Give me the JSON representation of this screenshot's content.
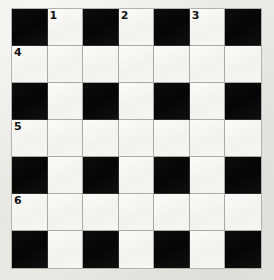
{
  "puzzle": {
    "title": "Crossword Grid",
    "rows": 7,
    "columns": 7,
    "colors": {
      "background": "#eceae6",
      "white_cell": "#f6f5f2",
      "black_cell": "#0a0a0a",
      "gridline": "#a9a9a6",
      "number_text": "#111111"
    },
    "grid": [
      [
        {
          "type": "block",
          "number": null,
          "letter": null
        },
        {
          "type": "open",
          "number": "1",
          "letter": null
        },
        {
          "type": "block",
          "number": null,
          "letter": null
        },
        {
          "type": "open",
          "number": "2",
          "letter": null
        },
        {
          "type": "block",
          "number": null,
          "letter": null
        },
        {
          "type": "open",
          "number": "3",
          "letter": null
        },
        {
          "type": "block",
          "number": null,
          "letter": null
        }
      ],
      [
        {
          "type": "open",
          "number": "4",
          "letter": null
        },
        {
          "type": "open",
          "number": null,
          "letter": null
        },
        {
          "type": "open",
          "number": null,
          "letter": null
        },
        {
          "type": "open",
          "number": null,
          "letter": null
        },
        {
          "type": "open",
          "number": null,
          "letter": null
        },
        {
          "type": "open",
          "number": null,
          "letter": null
        },
        {
          "type": "open",
          "number": null,
          "letter": null
        }
      ],
      [
        {
          "type": "block",
          "number": null,
          "letter": null
        },
        {
          "type": "open",
          "number": null,
          "letter": null
        },
        {
          "type": "block",
          "number": null,
          "letter": null
        },
        {
          "type": "open",
          "number": null,
          "letter": null
        },
        {
          "type": "block",
          "number": null,
          "letter": null
        },
        {
          "type": "open",
          "number": null,
          "letter": null
        },
        {
          "type": "block",
          "number": null,
          "letter": null
        }
      ],
      [
        {
          "type": "open",
          "number": "5",
          "letter": null
        },
        {
          "type": "open",
          "number": null,
          "letter": null
        },
        {
          "type": "open",
          "number": null,
          "letter": null
        },
        {
          "type": "open",
          "number": null,
          "letter": null
        },
        {
          "type": "open",
          "number": null,
          "letter": null
        },
        {
          "type": "open",
          "number": null,
          "letter": null
        },
        {
          "type": "open",
          "number": null,
          "letter": null
        }
      ],
      [
        {
          "type": "block",
          "number": null,
          "letter": null
        },
        {
          "type": "open",
          "number": null,
          "letter": null
        },
        {
          "type": "block",
          "number": null,
          "letter": null
        },
        {
          "type": "open",
          "number": null,
          "letter": null
        },
        {
          "type": "block",
          "number": null,
          "letter": null
        },
        {
          "type": "open",
          "number": null,
          "letter": null
        },
        {
          "type": "block",
          "number": null,
          "letter": null
        }
      ],
      [
        {
          "type": "open",
          "number": "6",
          "letter": null
        },
        {
          "type": "open",
          "number": null,
          "letter": null
        },
        {
          "type": "open",
          "number": null,
          "letter": null
        },
        {
          "type": "open",
          "number": null,
          "letter": null
        },
        {
          "type": "open",
          "number": null,
          "letter": null
        },
        {
          "type": "open",
          "number": null,
          "letter": null
        },
        {
          "type": "open",
          "number": null,
          "letter": null
        }
      ],
      [
        {
          "type": "block",
          "number": null,
          "letter": null
        },
        {
          "type": "open",
          "number": null,
          "letter": null
        },
        {
          "type": "block",
          "number": null,
          "letter": null
        },
        {
          "type": "open",
          "number": null,
          "letter": null
        },
        {
          "type": "block",
          "number": null,
          "letter": null
        },
        {
          "type": "open",
          "number": null,
          "letter": null
        },
        {
          "type": "block",
          "number": null,
          "letter": null
        }
      ]
    ]
  }
}
